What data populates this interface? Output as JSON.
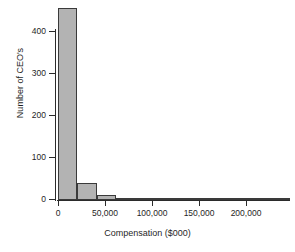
{
  "chart_data": {
    "type": "bar",
    "title": "",
    "xlabel": "Compensation ($000)",
    "ylabel": "Number of CEO's",
    "xlim": [
      0,
      240000
    ],
    "ylim": [
      0,
      440
    ],
    "grid": false,
    "legend": null,
    "bin_width": 20000,
    "bin_edges": [
      0,
      20000,
      40000,
      60000,
      80000,
      100000,
      120000,
      140000,
      160000,
      180000,
      200000,
      220000,
      240000
    ],
    "categories": [
      "0-20,000",
      "20,000-40,000",
      "40,000-60,000",
      "60,000-80,000",
      "80,000-100,000",
      "100,000-120,000",
      "120,000-140,000",
      "140,000-160,000",
      "160,000-180,000",
      "180,000-200,000",
      "200,000-220,000",
      "220,000-240,000"
    ],
    "values": [
      440,
      38,
      12,
      3,
      3,
      0,
      2,
      2,
      0,
      0,
      0,
      2
    ],
    "xticks": [
      0,
      50000,
      100000,
      150000,
      200000
    ],
    "xtick_labels": [
      "0",
      "50,000",
      "100,000",
      "150,000",
      "200,000"
    ],
    "yticks": [
      0,
      100,
      200,
      300,
      400
    ],
    "ytick_labels": [
      "0",
      "100",
      "200",
      "300",
      "400"
    ],
    "bar_fill_color": "#b3b3b3",
    "bar_border_color": "#3a3a3a",
    "axis_color": "#2b2b2b",
    "background_color": "#ffffff"
  }
}
